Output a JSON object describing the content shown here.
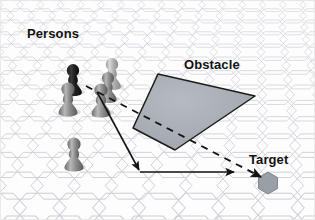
{
  "figure": {
    "title_labels": {
      "persons": "Persons",
      "obstacle": "Obstacle",
      "target": "Target"
    },
    "background": {
      "name": "hexagonal-grid-floor",
      "grid_color": "#c9cbd4",
      "fill_color": "#fdfdfd",
      "rows": 13,
      "perspective": "hexagons shrink toward top"
    },
    "persons": [
      {
        "id": "person-1",
        "label": "dark pawn rear-left",
        "x": 73,
        "y": 70,
        "scale": 1.0,
        "shade": "dark",
        "color": "#2b2b2b"
      },
      {
        "id": "person-2",
        "label": "light pawn rear-right",
        "x": 112,
        "y": 64,
        "scale": 1.0,
        "shade": "light",
        "color": "#b4b4b4"
      },
      {
        "id": "person-3",
        "label": "gray pawn mid-right",
        "x": 108,
        "y": 78,
        "scale": 0.95,
        "shade": "medium",
        "color": "#9a9a9a"
      },
      {
        "id": "person-4",
        "label": "gray pawn front-left",
        "x": 68,
        "y": 88,
        "scale": 1.05,
        "shade": "medium",
        "color": "#8f8f8f"
      },
      {
        "id": "person-5",
        "label": "gray pawn front-right",
        "x": 101,
        "y": 89,
        "scale": 1.05,
        "shade": "medium",
        "color": "#8a8a8a"
      },
      {
        "id": "person-6",
        "label": "gray pawn isolated",
        "x": 73,
        "y": 143,
        "scale": 1.05,
        "shade": "medium",
        "color": "#8a8a8a"
      }
    ],
    "obstacle": {
      "name": "obstacle-polygon",
      "fill": "#a9adb5",
      "stroke": "#1c1c1c",
      "points": "158,74 255,96 175,150 133,128"
    },
    "target": {
      "name": "target-hexagon",
      "fill": "#9a9ea6",
      "stroke": "#6f737a",
      "cx": 268,
      "cy": 183,
      "r": 11
    },
    "paths": [
      {
        "id": "direct-path",
        "style": "dashed",
        "label": "direct line-of-sight path through obstacle",
        "color": "#141414",
        "points": "86,86 262,178",
        "arrowhead": "end"
      },
      {
        "id": "detour-path",
        "style": "solid",
        "label": "detour path around obstacle",
        "color": "#141414",
        "points": "97,92 140,172 236,172",
        "arrowheads": "mid-and-end"
      }
    ]
  }
}
